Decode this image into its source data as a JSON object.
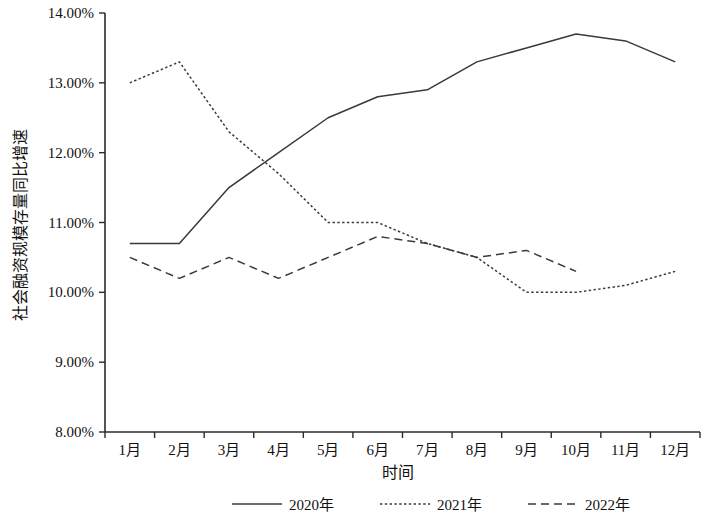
{
  "chart_data": {
    "type": "line",
    "title": "",
    "xlabel": "时间",
    "ylabel": "社会融资规模存量同比增速",
    "categories": [
      "1月",
      "2月",
      "3月",
      "4月",
      "5月",
      "6月",
      "7月",
      "8月",
      "9月",
      "10月",
      "11月",
      "12月"
    ],
    "ylim": [
      8.0,
      14.0
    ],
    "ytick_labels": [
      "14.00%",
      "13.00%",
      "12.00%",
      "11.00%",
      "10.00%",
      "9.00%",
      "8.00%"
    ],
    "ytick_values": [
      14.0,
      13.0,
      12.0,
      11.0,
      10.0,
      9.0,
      8.0
    ],
    "grid": false,
    "legend_position": "bottom",
    "series": [
      {
        "name": "2020年",
        "style": "solid",
        "color": "#3a3a3a",
        "values": [
          10.7,
          10.7,
          11.5,
          12.0,
          12.5,
          12.8,
          12.9,
          13.3,
          13.5,
          13.7,
          13.6,
          13.3
        ]
      },
      {
        "name": "2021年",
        "style": "dotted",
        "color": "#3a3a3a",
        "values": [
          13.0,
          13.3,
          12.3,
          11.7,
          11.0,
          11.0,
          10.7,
          10.5,
          10.0,
          10.0,
          10.1,
          10.3
        ]
      },
      {
        "name": "2022年",
        "style": "dashed",
        "color": "#3a3a3a",
        "values": [
          10.5,
          10.2,
          10.5,
          10.2,
          10.5,
          10.8,
          10.7,
          10.5,
          10.6,
          10.3,
          null,
          null
        ]
      }
    ]
  },
  "axes": {
    "y_title": "社会融资规模存量同比增速",
    "x_title": "时间"
  },
  "legend": {
    "items": [
      {
        "label": "2020年",
        "style": "solid"
      },
      {
        "label": "2021年",
        "style": "dotted"
      },
      {
        "label": "2022年",
        "style": "dashed"
      }
    ]
  }
}
